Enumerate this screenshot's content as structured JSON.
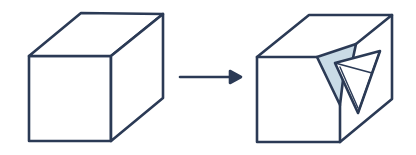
{
  "diagram": {
    "colors": {
      "stroke": "#2b3a55",
      "chip_fill": "#c9dbe6",
      "face_fill": "#ffffff",
      "background": "#ffffff"
    },
    "elements": [
      {
        "id": "intact-cube",
        "label": "Intact cube"
      },
      {
        "id": "transition-arrow",
        "label": "Arrow"
      },
      {
        "id": "chipped-cube",
        "label": "Chipped cube with broken fragment"
      }
    ]
  }
}
